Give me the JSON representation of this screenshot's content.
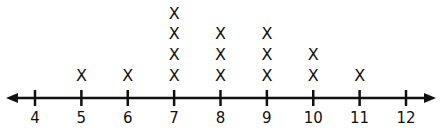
{
  "chart_data": {
    "type": "scatter",
    "subtype": "line-plot (dot plot with X marks)",
    "title": "",
    "xlabel": "",
    "ylabel": "",
    "x_ticks": [
      4,
      5,
      6,
      7,
      8,
      9,
      10,
      11,
      12
    ],
    "xlim": [
      4,
      12
    ],
    "marker": "X",
    "categories": [
      4,
      5,
      6,
      7,
      8,
      9,
      10,
      11,
      12
    ],
    "values": [
      0,
      1,
      1,
      4,
      3,
      3,
      2,
      1,
      0
    ],
    "grid": false,
    "legend": null,
    "axis_arrows": "both ends"
  },
  "colors": {
    "ink": "#111111",
    "background": "#ffffff"
  }
}
